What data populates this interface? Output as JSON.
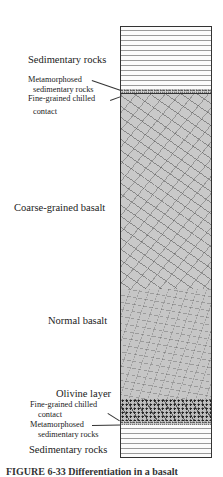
{
  "diagram": {
    "type": "stratigraphic-column",
    "layers_top_to_bottom": [
      {
        "name": "Sedimentary rocks",
        "pattern": "horizontal-lines"
      },
      {
        "name": "Metamorphosed sedimentary rocks",
        "pattern": "fine-speckle"
      },
      {
        "name": "Fine-grained chilled contact",
        "pattern": "dark-line"
      },
      {
        "name": "Coarse-grained basalt",
        "pattern": "random-laths"
      },
      {
        "name": "Normal basalt",
        "pattern": "fine-laths"
      },
      {
        "name": "Olivine layer",
        "pattern": "dark-crystals"
      },
      {
        "name": "Fine-grained chilled contact",
        "pattern": "dark-line"
      },
      {
        "name": "Metamorphosed sedimentary rocks",
        "pattern": "fine-speckle"
      },
      {
        "name": "Sedimentary rocks",
        "pattern": "horizontal-lines"
      }
    ]
  },
  "labels": {
    "sed_top": "Sedimentary rocks",
    "meta_top_1": "Metamorphosed",
    "meta_top_2": "sedimentary rocks",
    "chill_top_1": "Fine-grained chilled",
    "chill_top_2": "contact",
    "coarse": "Coarse-grained basalt",
    "normal": "Normal basalt",
    "olivine": "Olivine layer",
    "chill_bot_1": "Fine-grained chilled",
    "chill_bot_2": "contact",
    "meta_bot_1": "Metamorphosed",
    "meta_bot_2": "sedimentary rocks",
    "sed_bot": "Sedimentary rocks"
  },
  "caption": "FIGURE 6-33  Differentiation in a basalt"
}
